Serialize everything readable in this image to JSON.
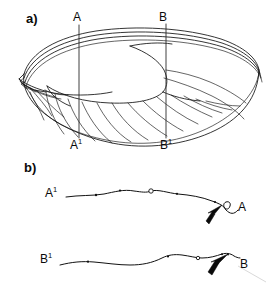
{
  "figure": {
    "panels": [
      {
        "id": "a",
        "label": "a)"
      },
      {
        "id": "b",
        "label": "b)"
      }
    ]
  },
  "panel_a": {
    "label": "a)",
    "section_lines": [
      {
        "id": "A",
        "top_label": "A",
        "top_label_sup": "",
        "bottom_label": "A",
        "bottom_label_sup": "1",
        "x": 79,
        "y_top": 25,
        "y_bottom": 138
      },
      {
        "id": "B",
        "top_label": "B",
        "top_label_sup": "",
        "bottom_label": "B",
        "bottom_label_sup": "1",
        "x": 166,
        "y_top": 24,
        "y_bottom": 138
      }
    ],
    "subject": "shell-valve-line-drawing"
  },
  "panel_b": {
    "label": "b)",
    "profiles": [
      {
        "id": "A",
        "left_label": "A",
        "left_label_sup": "1",
        "right_label": "A",
        "right_label_sup": "",
        "markers": [
          {
            "type": "dot",
            "x": 96,
            "y": 195
          },
          {
            "type": "dot",
            "x": 120,
            "y": 191
          },
          {
            "type": "open-circle",
            "x": 151,
            "y": 191
          },
          {
            "type": "dot",
            "x": 177,
            "y": 193
          },
          {
            "type": "dot",
            "x": 216,
            "y": 200
          },
          {
            "type": "open-circle",
            "x": 226,
            "y": 206
          }
        ],
        "arrow": {
          "from_x": 206,
          "from_y": 224,
          "to_x": 224,
          "to_y": 208
        }
      },
      {
        "id": "B",
        "left_label": "B",
        "left_label_sup": "1",
        "right_label": "B",
        "right_label_sup": "",
        "markers": [
          {
            "type": "dot",
            "x": 88,
            "y": 262
          },
          {
            "type": "dot",
            "x": 170,
            "y": 256
          },
          {
            "type": "open-circle",
            "x": 198,
            "y": 258
          },
          {
            "type": "dot",
            "x": 222,
            "y": 255
          },
          {
            "type": "dot",
            "x": 228,
            "y": 254
          }
        ],
        "arrow": {
          "from_x": 208,
          "from_y": 276,
          "to_x": 228,
          "to_y": 258
        }
      }
    ]
  },
  "colors": {
    "ink": "#121212",
    "section_line": "#2b2b2b",
    "background": "#ffffff",
    "leader": "#c9c9c9"
  }
}
